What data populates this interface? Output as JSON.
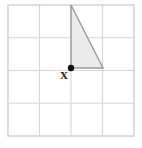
{
  "figure": {
    "background_color": "#ffffff",
    "grid": {
      "columns": 4,
      "rows": 4,
      "left": 8,
      "top": 5,
      "cell_width": 31.5,
      "cell_height": 32.75,
      "line_color": "#d6d6d6",
      "border_color": "#cfcfcf",
      "line_width": 1.1,
      "border_width": 1.4,
      "x_lines": [
        8,
        39.5,
        71,
        102.5,
        134
      ],
      "y_lines": [
        5,
        37.75,
        70.5,
        103.25,
        136
      ]
    },
    "triangle": {
      "name": "shaded-right-triangle",
      "points": "71,5 71,68 103,68",
      "vertices": [
        {
          "x": 71,
          "y": 5
        },
        {
          "x": 71,
          "y": 68
        },
        {
          "x": 103,
          "y": 68
        }
      ],
      "fill_color": "#ebebeb",
      "stroke_color": "#9a9a9a",
      "stroke_width": 1.4,
      "base_cells": 1,
      "height_cells": 2
    },
    "marked_point": {
      "label": "X",
      "x": 71,
      "y": 68,
      "radius": 3.2,
      "color": "#111111",
      "label_x": 64,
      "label_y": 79
    }
  }
}
